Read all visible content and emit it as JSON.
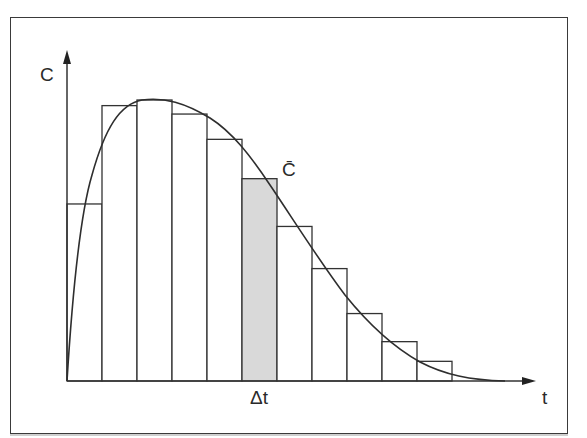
{
  "diagram": {
    "y_axis_label": "C",
    "x_axis_label": "t",
    "curve_label": "C̄",
    "interval_label": "Δt",
    "colors": {
      "line": "#333333",
      "shaded_bar": "#d9d9d9",
      "frame": "#3a3a3a"
    }
  },
  "chart_data": {
    "type": "bar",
    "title": "",
    "xlabel": "t",
    "ylabel": "C",
    "bar_width_label": "Δt",
    "categories": [
      "1",
      "2",
      "3",
      "4",
      "5",
      "6",
      "7",
      "8",
      "9",
      "10",
      "11"
    ],
    "values": [
      0.63,
      0.98,
      1.0,
      0.95,
      0.86,
      0.72,
      0.55,
      0.4,
      0.24,
      0.14,
      0.07
    ],
    "highlighted_index": 5,
    "curve": {
      "label": "C̄",
      "shape": "rises steeply from origin, peaks near bar 3, decays smoothly toward zero"
    },
    "ylim": [
      0,
      1.0
    ],
    "grid": false
  }
}
